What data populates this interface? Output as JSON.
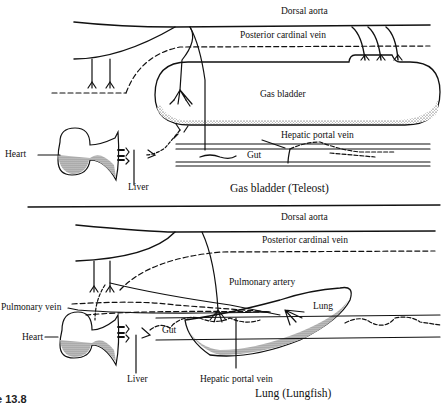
{
  "figure_number": "e 13.8",
  "panels": [
    {
      "caption": "Gas bladder (Teleost)",
      "labels": {
        "dorsal_aorta": "Dorsal aorta",
        "posterior_cardinal_vein": "Posterior  cardinal vein",
        "gas_bladder": "Gas bladder",
        "hepatic_portal_vein": "Hepatic portal vein",
        "gut": "Gut",
        "heart": "Heart",
        "liver": "Liver"
      }
    },
    {
      "caption": "Lung (Lungfish)",
      "labels": {
        "dorsal_aorta": "Dorsal aorta",
        "posterior_cardinal_vein": "Posterior  cardinal vein",
        "pulmonary_artery": "Pulmonary artery",
        "pulmonary_vein": "Pulmonary vein",
        "lung": "Lung",
        "gut": "Gut",
        "heart": "Heart",
        "liver": "Liver",
        "hepatic_portal_vein": "Hepatic portal vein"
      }
    }
  ],
  "colors": {
    "ink": "#111111",
    "background": "#ffffff"
  }
}
